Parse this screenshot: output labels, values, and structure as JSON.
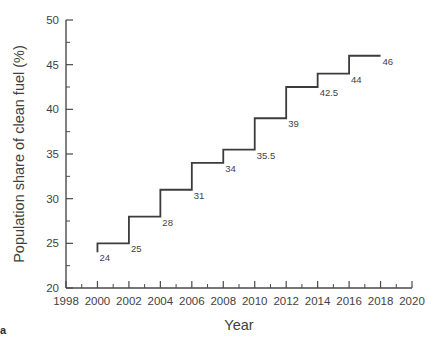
{
  "chart_data": {
    "type": "line",
    "line_style": "step-post",
    "title": "",
    "xlabel": "Year",
    "ylabel": "Population share of clean fuel (%)",
    "xlim": [
      1998,
      2020
    ],
    "ylim": [
      20,
      50
    ],
    "x_major_ticks": [
      1998,
      2000,
      2002,
      2004,
      2006,
      2008,
      2010,
      2012,
      2014,
      2016,
      2018,
      2020
    ],
    "x_tick_labels": [
      "1998",
      "2000",
      "2002",
      "2004",
      "2006",
      "2008",
      "2010",
      "2012",
      "2014",
      "2016",
      "2018",
      "2020"
    ],
    "x_minor_ticks": [
      1999,
      2001,
      2003,
      2005,
      2007,
      2009,
      2011,
      2013,
      2015,
      2017,
      2019
    ],
    "y_major_ticks": [
      20,
      25,
      30,
      35,
      40,
      45,
      50
    ],
    "y_tick_labels": [
      "20",
      "25",
      "30",
      "35",
      "40",
      "45",
      "50"
    ],
    "y_minor_ticks": [
      22.5,
      27.5,
      32.5,
      37.5,
      42.5,
      47.5
    ],
    "grid": false,
    "legend": false,
    "legend_position": "none",
    "line_color": "#3c3c3c",
    "line_width": 1.8,
    "x": [
      2000,
      2002,
      2004,
      2006,
      2008,
      2010,
      2012,
      2014,
      2016,
      2018
    ],
    "values": [
      24,
      25,
      28,
      31,
      34,
      35.5,
      39,
      42.5,
      44,
      46
    ],
    "point_labels": [
      "24",
      "25",
      "28",
      "31",
      "34",
      "35.5",
      "39",
      "42.5",
      "44",
      "46"
    ],
    "series": [
      {
        "name": "Population share of clean fuel",
        "points": [
          {
            "year": 2000,
            "value": 24,
            "label": "24"
          },
          {
            "year": 2002,
            "value": 25,
            "label": "25"
          },
          {
            "year": 2004,
            "value": 28,
            "label": "28"
          },
          {
            "year": 2006,
            "value": 31,
            "label": "31"
          },
          {
            "year": 2008,
            "value": 34,
            "label": "34"
          },
          {
            "year": 2010,
            "value": 35.5,
            "label": "35.5"
          },
          {
            "year": 2012,
            "value": 39,
            "label": "39"
          },
          {
            "year": 2014,
            "value": 42.5,
            "label": "42.5"
          },
          {
            "year": 2016,
            "value": 44,
            "label": "44"
          },
          {
            "year": 2018,
            "value": 46,
            "label": "46"
          }
        ]
      }
    ]
  },
  "figure": {
    "caption_mark": "a"
  }
}
